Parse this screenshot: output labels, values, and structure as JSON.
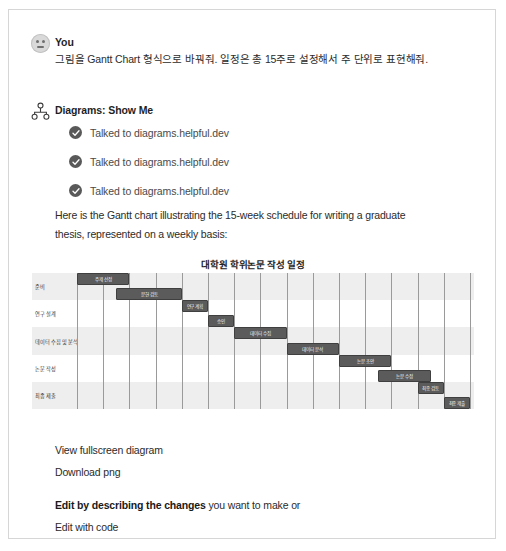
{
  "conversation": {
    "user": {
      "sender": "You",
      "avatar_icon": "user-avatar-face-icon",
      "message": "그림을 Gantt Chart 형식으로 바꿔줘. 일정은 총 15주로 설정해서 주 단위로 표현해줘."
    },
    "assistant": {
      "sender": "Diagrams: Show Me",
      "avatar_icon": "diagrams-plugin-icon",
      "tool_calls": [
        {
          "icon": "check-circle-icon",
          "label": "Talked to diagrams.helpful.dev"
        },
        {
          "icon": "check-circle-icon",
          "label": "Talked to diagrams.helpful.dev"
        },
        {
          "icon": "check-circle-icon",
          "label": "Talked to diagrams.helpful.dev"
        }
      ],
      "intro_line_1": "Here is the Gantt chart illustrating the 15-week schedule for writing a graduate",
      "intro_line_2": "thesis, represented on a weekly basis:"
    }
  },
  "footer": {
    "view_fullscreen": "View fullscreen diagram",
    "download_png": "Download png",
    "edit_bold": "Edit by describing the changes",
    "edit_rest": " you want to make or",
    "edit_with_code": "Edit with code"
  },
  "colors": {
    "bar_fill": "#5b5b5b",
    "bar_border": "#3f3f3f",
    "band_alt": "#eeeeee",
    "gridline": "#9a9a9a",
    "check_badge": "#595959",
    "page_border": "#d6d6d6"
  },
  "chart_data": {
    "type": "bar",
    "subtype": "gantt",
    "title": "대학원 학위논문 작성 일정",
    "xlabel": "",
    "ylabel": "",
    "xunit": "week",
    "xlim": [
      0,
      15
    ],
    "total_weeks": 15,
    "grid": true,
    "gridline_count": 15,
    "legend": "none",
    "categories": [
      "준비",
      "연구 설계",
      "데이터 수집 및 분석",
      "논문 작성",
      "최종 제출"
    ],
    "tasks": [
      {
        "name": "주제 선정",
        "row": 0,
        "start_week": 0,
        "end_week": 2,
        "duration": 2
      },
      {
        "name": "문헌 검토",
        "row": 0,
        "start_week": 1.5,
        "end_week": 4,
        "duration": 2.5
      },
      {
        "name": "연구 계획",
        "row": 1,
        "start_week": 4,
        "end_week": 5,
        "duration": 1
      },
      {
        "name": "승인",
        "row": 1,
        "start_week": 5,
        "end_week": 6,
        "duration": 1
      },
      {
        "name": "데이터 수집",
        "row": 2,
        "start_week": 6,
        "end_week": 8,
        "duration": 2
      },
      {
        "name": "데이터 분석",
        "row": 2,
        "start_week": 8,
        "end_week": 10,
        "duration": 2
      },
      {
        "name": "논문 초안",
        "row": 3,
        "start_week": 10,
        "end_week": 12,
        "duration": 2
      },
      {
        "name": "논문 수정",
        "row": 3,
        "start_week": 11.5,
        "end_week": 13.5,
        "duration": 2
      },
      {
        "name": "최종 검토",
        "row": 4,
        "start_week": 13,
        "end_week": 14,
        "duration": 1
      },
      {
        "name": "최종 제출",
        "row": 4,
        "start_week": 14,
        "end_week": 15,
        "duration": 1
      }
    ]
  }
}
